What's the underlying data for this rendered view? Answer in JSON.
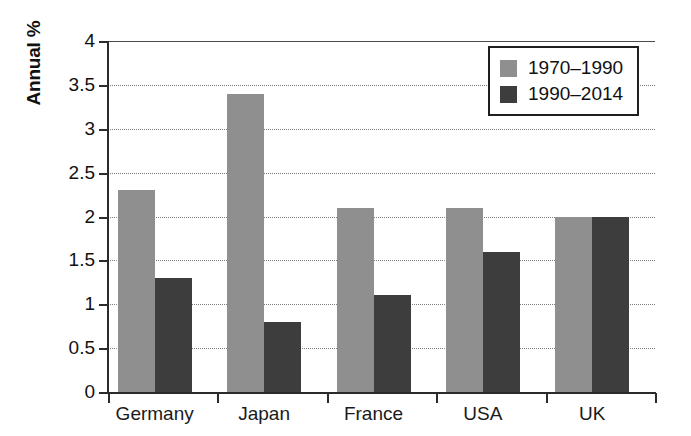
{
  "chart_data": {
    "type": "bar",
    "title": "",
    "xlabel": "",
    "ylabel": "Annual %",
    "ylim": [
      0,
      4
    ],
    "yticks": [
      "0",
      "0.5",
      "1",
      "1.5",
      "2",
      "2.5",
      "3",
      "3.5",
      "4"
    ],
    "ytick_values": [
      0,
      0.5,
      1,
      1.5,
      2,
      2.5,
      3,
      3.5,
      4
    ],
    "grid": true,
    "legend_position": "top-right",
    "categories": [
      "Germany",
      "Japan",
      "France",
      "USA",
      "UK"
    ],
    "series": [
      {
        "name": "1970–1990",
        "color": "#8f8f8f",
        "values": [
          2.3,
          3.4,
          2.1,
          2.1,
          2.0
        ]
      },
      {
        "name": "1990–2014",
        "color": "#3d3d3d",
        "values": [
          1.3,
          0.8,
          1.1,
          1.6,
          2.0
        ]
      }
    ]
  }
}
